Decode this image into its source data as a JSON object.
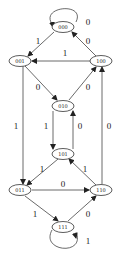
{
  "diagram": {
    "type": "state-transition-diagram",
    "nodes": [
      {
        "id": "000",
        "label": "000",
        "x": 63,
        "y": 27
      },
      {
        "id": "001",
        "label": "001",
        "x": 20,
        "y": 61
      },
      {
        "id": "100",
        "label": "100",
        "x": 101,
        "y": 61
      },
      {
        "id": "010",
        "label": "010",
        "x": 63,
        "y": 106
      },
      {
        "id": "101",
        "label": "101",
        "x": 63,
        "y": 154
      },
      {
        "id": "011",
        "label": "011",
        "x": 20,
        "y": 190
      },
      {
        "id": "110",
        "label": "110",
        "x": 101,
        "y": 190
      },
      {
        "id": "111",
        "label": "111",
        "x": 63,
        "y": 227
      }
    ],
    "edges": [
      {
        "from": "000",
        "to": "000",
        "label": "0"
      },
      {
        "from": "000",
        "to": "001",
        "label": "1"
      },
      {
        "from": "100",
        "to": "000",
        "label": "0"
      },
      {
        "from": "100",
        "to": "001",
        "label": "1"
      },
      {
        "from": "001",
        "to": "010",
        "label": "0"
      },
      {
        "from": "010",
        "to": "100",
        "label": "0"
      },
      {
        "from": "001",
        "to": "011",
        "label": "1"
      },
      {
        "from": "010",
        "to": "101",
        "label": "1"
      },
      {
        "from": "101",
        "to": "010",
        "label": "0"
      },
      {
        "from": "110",
        "to": "100",
        "label": "0"
      },
      {
        "from": "101",
        "to": "011",
        "label": "1"
      },
      {
        "from": "110",
        "to": "101",
        "label": "1"
      },
      {
        "from": "011",
        "to": "110",
        "label": "0"
      },
      {
        "from": "011",
        "to": "111",
        "label": "1"
      },
      {
        "from": "111",
        "to": "110",
        "label": "0"
      },
      {
        "from": "111",
        "to": "111",
        "label": "1"
      }
    ]
  },
  "labels": {
    "n000": "000",
    "n001": "001",
    "n100": "100",
    "n010": "010",
    "n101": "101",
    "n011": "011",
    "n110": "110",
    "n111": "111",
    "e_000_000": "0",
    "e_000_001": "1",
    "e_100_000": "0",
    "e_100_001": "1",
    "e_001_010": "0",
    "e_010_100": "0",
    "e_001_011": "1",
    "e_010_101": "1",
    "e_101_010": "0",
    "e_110_100": "0",
    "e_101_011": "1",
    "e_110_101": "1",
    "e_011_110": "0",
    "e_011_111": "1",
    "e_111_110": "0",
    "e_111_111": "1"
  },
  "colors": {
    "stroke": "#333333",
    "background": "#ffffff"
  }
}
